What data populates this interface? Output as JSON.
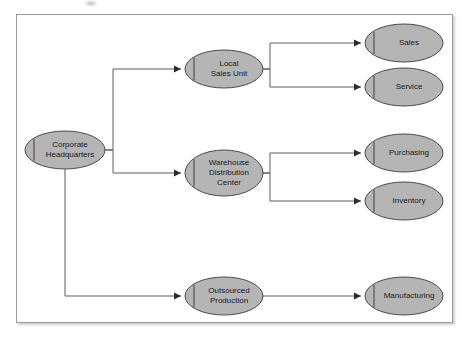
{
  "diagram": {
    "type": "hierarchy-tree",
    "frame": {
      "border_color": "#9a9a9a",
      "background_color": "#ffffff"
    },
    "style": {
      "node_fill": "#b5b5b5",
      "node_stroke": "#4a4a4a",
      "edge_color": "#5d5d5d",
      "label_color": "#17171a"
    },
    "nodes": [
      {
        "id": "corporate-headquarters",
        "label_lines": [
          "Corporate",
          "Headquarters"
        ],
        "cx": 65,
        "cy": 150,
        "rx": 40,
        "ry": 19,
        "level": 0
      },
      {
        "id": "local-sales-unit",
        "label_lines": [
          "Local",
          "Sales Unit"
        ],
        "cx": 224,
        "cy": 69,
        "rx": 39,
        "ry": 19,
        "level": 1
      },
      {
        "id": "warehouse-distribution-center",
        "label_lines": [
          "Warehouse",
          "Distribution",
          "Center"
        ],
        "cx": 224,
        "cy": 173,
        "rx": 39,
        "ry": 23,
        "level": 1
      },
      {
        "id": "outsourced-production",
        "label_lines": [
          "Outsourced",
          "Production"
        ],
        "cx": 224,
        "cy": 296,
        "rx": 39,
        "ry": 19,
        "level": 1
      },
      {
        "id": "sales",
        "label_lines": [
          "Sales"
        ],
        "cx": 404,
        "cy": 43,
        "rx": 39,
        "ry": 19,
        "level": 2
      },
      {
        "id": "service",
        "label_lines": [
          "Service"
        ],
        "cx": 404,
        "cy": 87,
        "rx": 39,
        "ry": 19,
        "level": 2
      },
      {
        "id": "purchasing",
        "label_lines": [
          "Purchasing"
        ],
        "cx": 404,
        "cy": 153,
        "rx": 39,
        "ry": 19,
        "level": 2
      },
      {
        "id": "inventory",
        "label_lines": [
          "Inventory"
        ],
        "cx": 404,
        "cy": 201,
        "rx": 39,
        "ry": 19,
        "level": 2
      },
      {
        "id": "manufacturing",
        "label_lines": [
          "Manufacturing"
        ],
        "cx": 404,
        "cy": 296,
        "rx": 39,
        "ry": 19,
        "level": 2
      }
    ],
    "edges": [
      {
        "id": "hq-to-local-sales-unit",
        "from": "corporate-headquarters",
        "to": "local-sales-unit",
        "path": "M105,150 L113,150 L113,69 L181,69",
        "arrow_at": [
          181,
          69
        ]
      },
      {
        "id": "hq-to-warehouse",
        "from": "corporate-headquarters",
        "to": "warehouse-distribution-center",
        "path": "M105,150 L113,150 L113,173 L181,173",
        "arrow_at": [
          181,
          173
        ]
      },
      {
        "id": "hq-to-outsourced-production",
        "from": "corporate-headquarters",
        "to": "outsourced-production",
        "path": "M65,169 L65,296 L181,296",
        "arrow_at": [
          181,
          296
        ]
      },
      {
        "id": "local-sales-unit-to-sales",
        "from": "local-sales-unit",
        "to": "sales",
        "path": "M263,69 L270,69 L270,43 L361,43",
        "arrow_at": [
          361,
          43
        ]
      },
      {
        "id": "local-sales-unit-to-service",
        "from": "local-sales-unit",
        "to": "service",
        "path": "M263,69 L270,69 L270,87 L361,87",
        "arrow_at": [
          361,
          87
        ]
      },
      {
        "id": "warehouse-to-purchasing",
        "from": "warehouse-distribution-center",
        "to": "purchasing",
        "path": "M263,173 L270,173 L270,153 L361,153",
        "arrow_at": [
          361,
          153
        ]
      },
      {
        "id": "warehouse-to-inventory",
        "from": "warehouse-distribution-center",
        "to": "inventory",
        "path": "M263,173 L270,173 L270,201 L361,201",
        "arrow_at": [
          361,
          201
        ]
      },
      {
        "id": "outsourced-production-to-manufacturing",
        "from": "outsourced-production",
        "to": "manufacturing",
        "path": "M263,296 L361,296",
        "arrow_at": [
          361,
          296
        ]
      }
    ]
  }
}
